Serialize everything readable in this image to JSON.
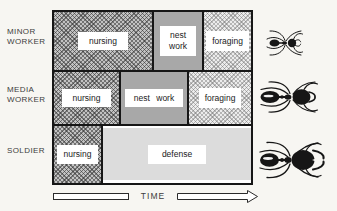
{
  "canvas": {
    "background": "#f7f6f2",
    "axis_label": "TIME"
  },
  "colors": {
    "frame_border": "#161616",
    "nursing_crosshatch_gray": "#a2a2a2",
    "nest_work_gray": "#a8a8a8",
    "foraging_crosshatch_gray": "#d2d2d2",
    "defense_gray": "#dcdcdc",
    "label_box": "#ffffff"
  },
  "rows": [
    {
      "caste_label": "MINOR\nWORKER",
      "ant_icon": "minor-worker-ant-icon",
      "tasks": [
        {
          "label": "nursing",
          "pattern": "crosshatch-dark"
        },
        {
          "label": "nest work",
          "pattern": "solid-gray"
        },
        {
          "label": "foraging",
          "pattern": "crosshatch-light"
        }
      ]
    },
    {
      "caste_label": "MEDIA\nWORKER",
      "ant_icon": "media-worker-ant-icon",
      "tasks": [
        {
          "label": "nursing",
          "pattern": "crosshatch-dark"
        },
        {
          "label": "nest work",
          "pattern": "solid-gray"
        },
        {
          "label": "foraging",
          "pattern": "crosshatch-light"
        }
      ]
    },
    {
      "caste_label": "SOLDIER",
      "ant_icon": "soldier-ant-icon",
      "tasks": [
        {
          "label": "nursing",
          "pattern": "crosshatch-dark"
        },
        {
          "label": "defense",
          "pattern": "solid-light"
        }
      ]
    }
  ],
  "icons": [
    "minor-worker-ant-icon",
    "media-worker-ant-icon",
    "soldier-ant-icon",
    "time-arrow-icon"
  ]
}
